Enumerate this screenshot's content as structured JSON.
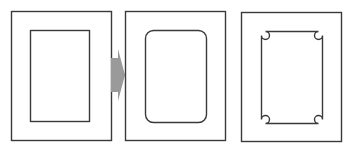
{
  "diagram": {
    "colors": {
      "stroke": "#3a3a3a",
      "arrow": "#9a9a9a",
      "background": "#ffffff"
    },
    "panels": [
      {
        "name": "square-corners",
        "outer": [
          11,
          11,
          100,
          129
        ],
        "inner": [
          30,
          30,
          59,
          91
        ]
      },
      {
        "name": "rounded-corners",
        "outer": [
          125,
          11,
          100,
          129
        ],
        "inner": [
          145,
          30,
          61,
          92
        ],
        "radius": 8
      },
      {
        "name": "notched-corners",
        "outer": [
          241,
          12,
          100,
          129
        ],
        "inner": [
          261,
          31,
          61,
          92
        ],
        "notch_radius": 4
      }
    ],
    "arrow": {
      "direction": "right",
      "x": 111,
      "y": 49,
      "w": 14,
      "h": 52
    }
  }
}
